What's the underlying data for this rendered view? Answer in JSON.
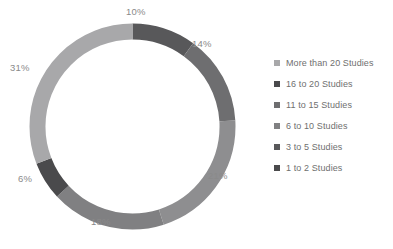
{
  "chart_data": {
    "type": "pie",
    "variant": "donut",
    "title": "",
    "xlabel": "",
    "ylabel": "",
    "start_angle_deg": 0,
    "direction": "clockwise",
    "inner_radius_ratio": 0.845,
    "legend_position": "right",
    "grid": false,
    "categories": [
      "1 to 2 Studies",
      "3 to 5 Studies",
      "6 to 10 Studies",
      "11 to 15 Studies",
      "16 to 20 Studies",
      "More than 20 Studies"
    ],
    "values": [
      10,
      14,
      21,
      18,
      6,
      31
    ],
    "value_labels": [
      "10%",
      "14%",
      "21%",
      "18%",
      "6%",
      "31%"
    ],
    "colors": [
      "#58585a",
      "#6e6e70",
      "#8e8e90",
      "#808082",
      "#4a4a4c",
      "#a8a8aa"
    ],
    "slices": [
      {
        "label": "1 to 2 Studies",
        "value": 10,
        "display": "10%",
        "color": "#58585a"
      },
      {
        "label": "3 to 5 Studies",
        "value": 14,
        "display": "14%",
        "color": "#6e6e70"
      },
      {
        "label": "6 to 10 Studies",
        "value": 21,
        "display": "21%",
        "color": "#8e8e90"
      },
      {
        "label": "11 to 15 Studies",
        "value": 18,
        "display": "18%",
        "color": "#808082"
      },
      {
        "label": "16 to 20 Studies",
        "value": 6,
        "display": "6%",
        "color": "#4a4a4c"
      },
      {
        "label": "More than 20 Studies",
        "value": 31,
        "display": "31%",
        "color": "#a8a8aa"
      }
    ]
  },
  "labels": {
    "s10": "10%",
    "s14": "14%",
    "s21": "21%",
    "s18": "18%",
    "s6": "6%",
    "s31": "31%"
  },
  "legend": {
    "items": [
      {
        "label": "More than 20 Studies",
        "color": "#a8a8aa"
      },
      {
        "label": "16 to 20 Studies",
        "color": "#4a4a4c"
      },
      {
        "label": "11 to 15 Studies",
        "color": "#6e6e70"
      },
      {
        "label": "6 to 10 Studies",
        "color": "#808082"
      },
      {
        "label": "3 to 5 Studies",
        "color": "#58585a"
      },
      {
        "label": "1 to 2 Studies",
        "color": "#4a4a4c"
      }
    ]
  }
}
